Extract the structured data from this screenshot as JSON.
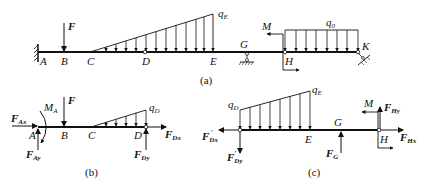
{
  "figure": {
    "type": "structural-mechanics-diagram",
    "panels": [
      {
        "id": "a",
        "caption": "(a)",
        "points": [
          "A",
          "B",
          "C",
          "D",
          "E",
          "G",
          "H",
          "K"
        ],
        "loads": {
          "concentrated_force": "F",
          "linear_distributed_peak": "q",
          "linear_distributed_peak_sub": "E",
          "uniform_distributed": "q",
          "uniform_distributed_sub": "0",
          "moment": "M"
        },
        "supports": [
          "fixed-A",
          "roller-G",
          "pin-K"
        ]
      },
      {
        "id": "b",
        "caption": "(b)",
        "points": [
          "A",
          "B",
          "C",
          "D"
        ],
        "forces": {
          "FAx": {
            "main": "F",
            "sub": "Ax"
          },
          "FAy": {
            "main": "F",
            "sub": "Ay"
          },
          "MA": {
            "main": "M",
            "sub": "A"
          },
          "F": {
            "main": "F"
          },
          "qD": {
            "main": "q",
            "sub": "D"
          },
          "FDx": {
            "main": "F",
            "sub": "Dx"
          },
          "FDy": {
            "main": "F",
            "sub": "Dy"
          }
        }
      },
      {
        "id": "c",
        "caption": "(c)",
        "points": [
          "E",
          "G",
          "H"
        ],
        "forces": {
          "qD": {
            "main": "q",
            "sub": "D"
          },
          "qE": {
            "main": "q",
            "sub": "E"
          },
          "FDx_prime": {
            "main": "F",
            "sub": "Dx",
            "prime": "′"
          },
          "FDy_prime": {
            "main": "F",
            "sub": "Dy",
            "prime": "′"
          },
          "FG": {
            "main": "F",
            "sub": "G"
          },
          "M": {
            "main": "M"
          },
          "FHy": {
            "main": "F",
            "sub": "Hy"
          },
          "FHx": {
            "main": "F",
            "sub": "Hx"
          }
        }
      }
    ]
  }
}
